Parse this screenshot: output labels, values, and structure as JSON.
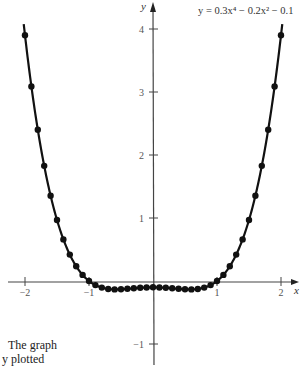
{
  "chart_data": {
    "type": "line",
    "equation_label": "y = 0.3x⁴ − 0.2x² − 0.1",
    "xlabel": "x",
    "ylabel": "y",
    "xlim": [
      -2.2,
      2.2
    ],
    "ylim": [
      -1.2,
      4.3
    ],
    "x_ticks": [
      -2,
      -1,
      1,
      2
    ],
    "x_tick_labels": [
      "−2",
      "−1",
      "1",
      "2"
    ],
    "y_ticks": [
      -1,
      1,
      2,
      3,
      4
    ],
    "y_tick_labels": [
      "−1",
      "1",
      "2",
      "3",
      "4"
    ],
    "grid": false,
    "markers": true,
    "series": [
      {
        "name": "y = 0.3x^4 - 0.2x^2 - 0.1",
        "x": [
          -2.0,
          -1.9,
          -1.8,
          -1.7,
          -1.6,
          -1.5,
          -1.4,
          -1.3,
          -1.2,
          -1.1,
          -1.0,
          -0.9,
          -0.8,
          -0.7,
          -0.6,
          -0.5,
          -0.4,
          -0.3,
          -0.2,
          -0.1,
          0.0,
          0.1,
          0.2,
          0.3,
          0.4,
          0.5,
          0.6,
          0.7,
          0.8,
          0.9,
          1.0,
          1.1,
          1.2,
          1.3,
          1.4,
          1.5,
          1.6,
          1.7,
          1.8,
          1.9,
          2.0
        ],
        "values": [
          3.9,
          3.087,
          2.401,
          1.828,
          1.354,
          0.969,
          0.66,
          0.419,
          0.234,
          0.097,
          0.0,
          -0.065,
          -0.105,
          -0.126,
          -0.133,
          -0.131,
          -0.124,
          -0.116,
          -0.108,
          -0.102,
          -0.1,
          -0.102,
          -0.108,
          -0.116,
          -0.124,
          -0.131,
          -0.133,
          -0.126,
          -0.105,
          -0.065,
          0.0,
          0.097,
          0.234,
          0.419,
          0.66,
          0.969,
          1.354,
          1.828,
          2.401,
          3.087,
          3.9
        ]
      }
    ]
  },
  "caption": {
    "line1": "The graph",
    "line2": "y plotted"
  }
}
